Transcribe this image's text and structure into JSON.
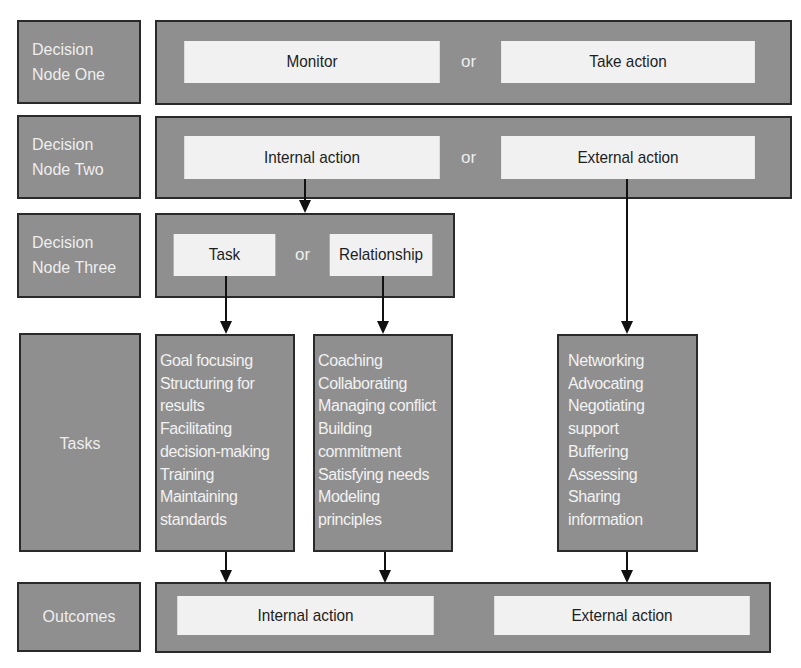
{
  "colors": {
    "box_fill": "#8f8f8f",
    "inner_fill": "#f1f1f1",
    "border": "#2a2a2a",
    "label_text": "#eeeeee",
    "inner_text": "#1e1e1e"
  },
  "rows": {
    "node_one": {
      "label_line1": "Decision",
      "label_line2": "Node One",
      "option_a": "Monitor",
      "connector": "or",
      "option_b": "Take action"
    },
    "node_two": {
      "label_line1": "Decision",
      "label_line2": "Node Two",
      "option_a": "Internal action",
      "connector": "or",
      "option_b": "External action"
    },
    "node_three": {
      "label_line1": "Decision",
      "label_line2": "Node Three",
      "option_a": "Task",
      "connector": "or",
      "option_b": "Relationship"
    },
    "tasks": {
      "label": "Tasks",
      "task_list": [
        "Goal focusing",
        "Structuring for",
        "results",
        "Facilitating",
        "decision-making",
        "Training",
        "Maintaining",
        "standards"
      ],
      "relationship_list": [
        "Coaching",
        "Collaborating",
        "Managing conflict",
        "Building",
        "commitment",
        "Satisfying needs",
        "Modeling",
        "principles"
      ],
      "external_list": [
        "Networking",
        "Advocating",
        "Negotiating",
        "support",
        "Buffering",
        "Assessing",
        "Sharing",
        "information"
      ]
    },
    "outcomes": {
      "label": "Outcomes",
      "option_a": "Internal action",
      "option_b": "External action"
    }
  }
}
